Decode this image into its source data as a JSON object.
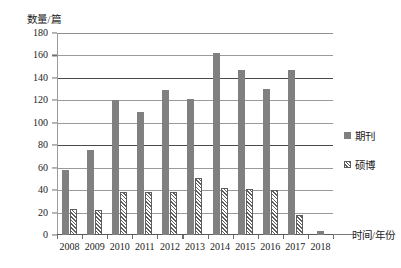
{
  "chart_data": {
    "type": "bar",
    "title": "",
    "xlabel": "时间/年份",
    "ylabel": "数量/篇",
    "categories": [
      "2008",
      "2009",
      "2010",
      "2011",
      "2012",
      "2013",
      "2014",
      "2015",
      "2016",
      "2017",
      "2018"
    ],
    "series": [
      {
        "name": "期刊",
        "color": "#808080",
        "fill": "solid",
        "values": [
          58,
          76,
          120,
          110,
          129,
          121,
          162,
          147,
          130,
          147,
          4
        ]
      },
      {
        "name": "硕博",
        "color": "#5d5d5d",
        "fill": "diagonal-hatch",
        "values": [
          23,
          22,
          38,
          38,
          38,
          51,
          42,
          41,
          40,
          18,
          0
        ]
      }
    ],
    "ylim": [
      0,
      180
    ],
    "ytick_step": 20,
    "yticks": [
      "180",
      "160",
      "140",
      "120",
      "100",
      "80",
      "60",
      "40",
      "20",
      "0"
    ],
    "grid": "horizontal",
    "legend_position": "right"
  },
  "axes": {
    "y_title": "数量/篇",
    "x_title": "时间/年份"
  },
  "legend": {
    "items": [
      {
        "label": "期刊"
      },
      {
        "label": "硕博"
      }
    ]
  },
  "colors": {
    "journal_bar": "#808080",
    "thesis_outline": "#5d5d5d",
    "gridline": "#9a9a9a",
    "gridline_strong": "#4a4a4a",
    "text": "#222222",
    "background": "#ffffff"
  }
}
